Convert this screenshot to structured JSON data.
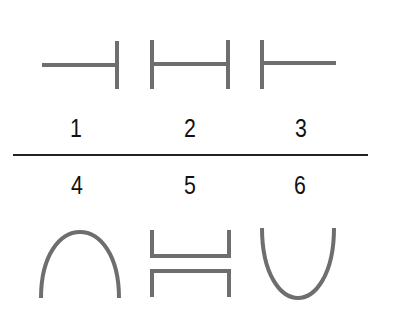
{
  "figure": {
    "stroke_color": "#6e6e6e",
    "divider_color": "#222222",
    "items": [
      {
        "label": "1",
        "shape": "left-line-right-bar"
      },
      {
        "label": "2",
        "shape": "double-bar-bridge"
      },
      {
        "label": "3",
        "shape": "left-bar-right-line"
      },
      {
        "label": "4",
        "shape": "arch"
      },
      {
        "label": "5",
        "shape": "split-bracket"
      },
      {
        "label": "6",
        "shape": "u-curve"
      }
    ]
  }
}
